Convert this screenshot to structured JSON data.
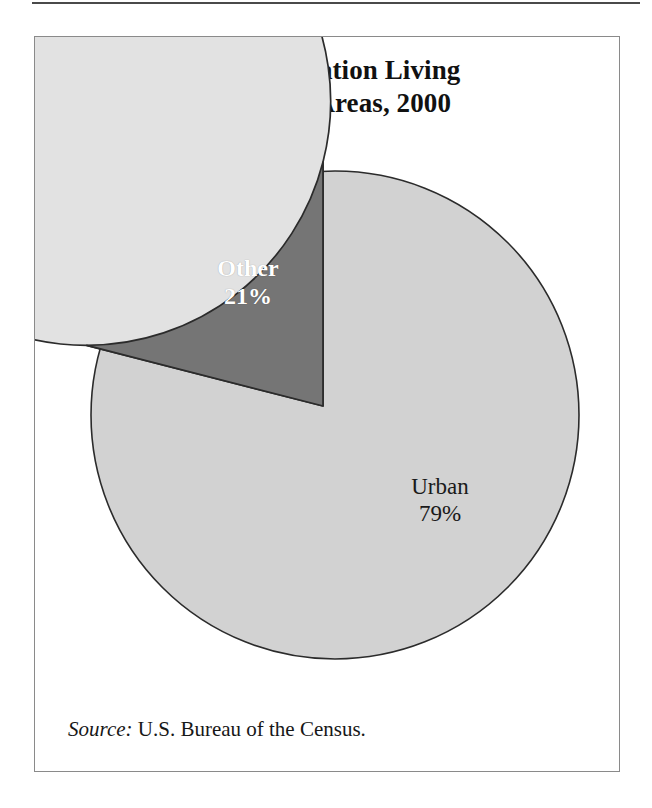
{
  "figure": {
    "title_line1": "U.S. Population Living",
    "title_line2": "in Urban Areas, 2000",
    "source_label": "Source:",
    "source_text": " U.S. Bureau of the Census."
  },
  "labels": {
    "other_name": "Other",
    "other_value": "21%",
    "urban_name": "Urban",
    "urban_value": "79%"
  },
  "colors": {
    "other_slice": "#757575",
    "urban_slice": "#e2e2e2",
    "slice_outline": "#2b2b2b",
    "box_border": "#8a8a8a",
    "rule": "#4a4a4a",
    "other_label_text": "#ffffff",
    "urban_label_text": "#1a1a1a",
    "shadow_side": "#d2d2d2"
  },
  "chart_data": {
    "type": "pie",
    "title": "U.S. Population Living in Urban Areas, 2000",
    "categories": [
      "Urban",
      "Other"
    ],
    "values": [
      79,
      21
    ],
    "unit": "percent",
    "data_labels": [
      "79%",
      "21%"
    ],
    "legend": "none",
    "legend_position": "inline-labels",
    "start_angle_deg": 90,
    "direction": "counterclockwise",
    "three_d": true,
    "slice_colors": [
      "#e2e2e2",
      "#757575"
    ],
    "source": "Source: U.S. Bureau of the Census.",
    "xlabel": "",
    "ylabel": ""
  }
}
